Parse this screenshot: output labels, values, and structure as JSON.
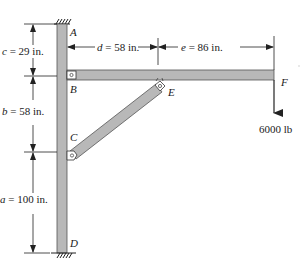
{
  "figure": {
    "points": {
      "A": "A",
      "B": "B",
      "C": "C",
      "D": "D",
      "E": "E",
      "F": "F"
    },
    "dimensions": {
      "c": {
        "var": "c",
        "text": " = 29 in."
      },
      "b": {
        "var": "b",
        "text": " = 58 in."
      },
      "a": {
        "var": "a",
        "text": " = 100 in."
      },
      "d": {
        "var": "d",
        "text": " = 58 in."
      },
      "e": {
        "var": "e",
        "text": " = 86 in."
      }
    },
    "load": {
      "text": "6000 lb"
    },
    "colors": {
      "member_fill": "#b8b8b8",
      "member_stroke": "#555555",
      "line": "#222222"
    }
  }
}
